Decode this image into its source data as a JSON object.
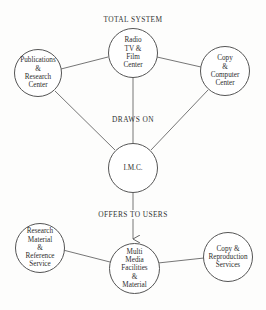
{
  "diagram": {
    "title": "TOTAL SYSTEM",
    "edge_labels": {
      "draws_on": "DRAWS ON",
      "offers_to_users": "OFFERS TO USERS"
    },
    "nodes": {
      "radio_tv_film": {
        "label": "Radio\nTV &\nFilm\nCenter"
      },
      "publications": {
        "label": "Publications\n&\nResearch\nCenter"
      },
      "copy_computer": {
        "label": "Copy\n&\nComputer\nCenter"
      },
      "imc": {
        "label": "I.M.C."
      },
      "multi_media": {
        "label": "Multi\nMedia\nFacilities\n&\nMaterial"
      },
      "research_material": {
        "label": "Research\nMaterial\n&\nReference\nService"
      },
      "copy_reproduction": {
        "label": "Copy &\nReproduction\nServices"
      }
    },
    "edges": [
      {
        "from": "publications",
        "to": "radio_tv_film",
        "type": "line"
      },
      {
        "from": "radio_tv_film",
        "to": "copy_computer",
        "type": "line"
      },
      {
        "from": "publications",
        "to": "imc",
        "type": "line"
      },
      {
        "from": "radio_tv_film",
        "to": "imc",
        "type": "line",
        "label": "DRAWS ON"
      },
      {
        "from": "copy_computer",
        "to": "imc",
        "type": "line"
      },
      {
        "from": "imc",
        "to": "multi_media",
        "type": "arrow",
        "label": "OFFERS TO USERS"
      },
      {
        "from": "research_material",
        "to": "multi_media",
        "type": "line"
      },
      {
        "from": "multi_media",
        "to": "copy_reproduction",
        "type": "line"
      }
    ]
  }
}
